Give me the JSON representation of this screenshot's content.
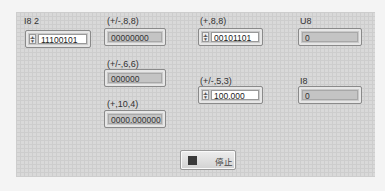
{
  "controls": {
    "i8_2": {
      "label": "I8 2",
      "value": "11100101"
    },
    "fx_s88": {
      "label": "(+/-,8,8)",
      "value": "00000000"
    },
    "fx_u88": {
      "label": "(+,8,8)",
      "value": "00101101"
    },
    "u8": {
      "label": "U8",
      "value": "0"
    },
    "fx_s66": {
      "label": "(+/-,6,6)",
      "value": "000000"
    },
    "fx_s53": {
      "label": "(+/-,5,3)",
      "value": "100.000"
    },
    "i8": {
      "label": "I8",
      "value": "0"
    },
    "fx_u104": {
      "label": "(+,10,4)",
      "value": "0000.000000"
    }
  },
  "stop_button": {
    "label": "停止"
  },
  "icons": {
    "spinner_up": "▲",
    "spinner_down": "▼"
  }
}
